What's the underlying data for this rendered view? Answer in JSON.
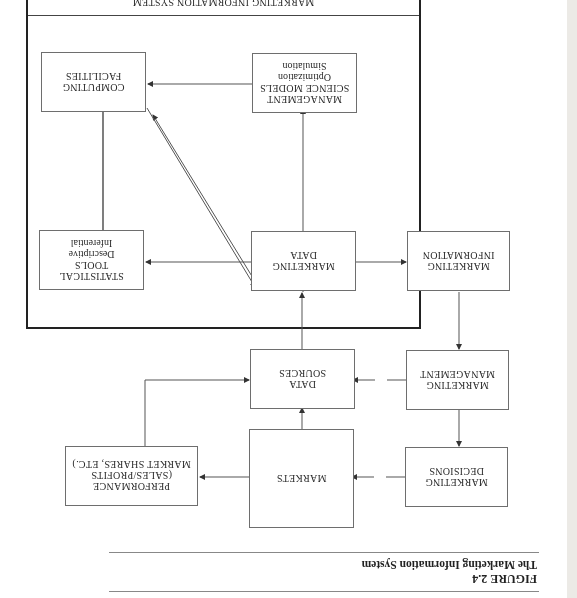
{
  "figure": {
    "number": "FIGURE 2.4",
    "caption": "The Marketing Information System"
  },
  "system_box": {
    "title": "MARKETING INFORMATION SYSTEM"
  },
  "boxes": {
    "computing_facilities": {
      "lines": [
        "COMPUTING",
        "FACILITIES"
      ]
    },
    "management_science_models": {
      "lines": [
        "MANAGEMENT",
        "SCIENCE MODELS"
      ],
      "sub": [
        "Optimization",
        "Simulation"
      ]
    },
    "statistical_tools": {
      "lines": [
        "STATISTICAL",
        "TOOLS"
      ],
      "sub": [
        "Descriptive",
        "Inferential"
      ]
    },
    "marketing_data": {
      "lines": [
        "MARKETING",
        "DATA"
      ]
    },
    "marketing_information": {
      "lines": [
        "MARKETING",
        "INFORMATION"
      ]
    },
    "data_sources": {
      "lines": [
        "DATA",
        "SOURCES"
      ]
    },
    "marketing_management": {
      "lines": [
        "MARKETING",
        "MANAGEMENT"
      ]
    },
    "performance": {
      "lines": [
        "PERFORMANCE",
        "(SALES/PROFITS",
        "MARKET SHARES, ETC.)"
      ]
    },
    "markets": {
      "lines": [
        "MARKETS"
      ]
    },
    "marketing_decisions": {
      "lines": [
        "MARKETING",
        "DECISIONS"
      ]
    }
  },
  "colors": {
    "line": "#555555",
    "frame": "#222222",
    "text": "#2a2a2a"
  }
}
